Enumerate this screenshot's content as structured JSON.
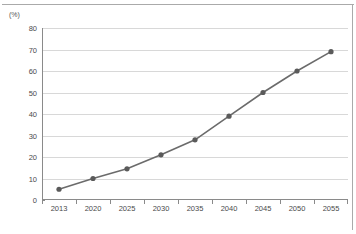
{
  "chart_data": {
    "type": "line",
    "title": "",
    "subtitle": "",
    "xlabel": "",
    "ylabel": "(%)",
    "y_unit_caption": "(%)",
    "categories": [
      "2013",
      "2020",
      "2025",
      "2030",
      "2035",
      "2040",
      "2045",
      "2050",
      "2055"
    ],
    "x": [
      2013,
      2020,
      2025,
      2030,
      2035,
      2040,
      2045,
      2050,
      2055
    ],
    "values": [
      5,
      10,
      14.5,
      21,
      28,
      39,
      50,
      60,
      69
    ],
    "series": [
      {
        "name": "",
        "values": [
          5,
          10,
          14.5,
          21,
          28,
          39,
          50,
          60,
          69
        ]
      }
    ],
    "ylim": [
      0,
      80
    ],
    "y_ticks": [
      0,
      10,
      20,
      30,
      40,
      50,
      60,
      70,
      80
    ],
    "y_tick_labels": [
      "0",
      "10",
      "20",
      "30",
      "40",
      "50",
      "60",
      "70",
      "80"
    ],
    "grid": true,
    "grid_axis": "y",
    "legend": false,
    "legend_position": "none",
    "marker": "circle",
    "annotations": []
  },
  "style": {
    "line_color": "#6b6b6b",
    "marker_color": "#5a5a5a",
    "grid_color": "#d8d8d8",
    "axis_color": "#8a8a8a",
    "frame_color": "#aaaaaa",
    "tick_label_color": "#4a4a4a",
    "background": "#ffffff"
  }
}
